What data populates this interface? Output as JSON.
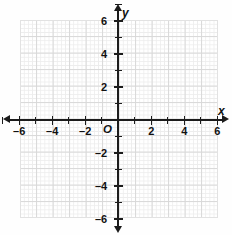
{
  "figure": {
    "type": "coordinate-plane",
    "x_axis_label": "x",
    "y_axis_label": "y",
    "origin_label": "O"
  },
  "chart_data": {
    "type": "scatter",
    "title": "",
    "subtitle": "",
    "xlabel": "x",
    "ylabel": "y",
    "xlim": [
      -7.2,
      6.1
    ],
    "ylim": [
      -6.1,
      7.2
    ],
    "grid": true,
    "legend": "none",
    "minor_ticks_per_major": 4,
    "major_tick_step": 1,
    "labeled_tick_step": 2,
    "x_tick_labels": [
      "-6",
      "-4",
      "-2",
      "2",
      "4",
      "6"
    ],
    "x_tick_values": [
      -6,
      -4,
      -2,
      2,
      4,
      6
    ],
    "y_tick_labels": [
      "6",
      "4",
      "2",
      "-2",
      "-4",
      "-6"
    ],
    "y_tick_values": [
      6,
      4,
      2,
      -2,
      -4,
      -6
    ],
    "x_unlabeled_tick_values": [
      -7,
      -5,
      -3,
      -1,
      1,
      3,
      5
    ],
    "y_unlabeled_tick_values": [
      7,
      5,
      3,
      1,
      -1,
      -3,
      -5
    ],
    "series": [],
    "annotations": [],
    "origin_marker": "O"
  },
  "ticks": {
    "x_labeled": [
      {
        "value": -6,
        "label": "-6"
      },
      {
        "value": -4,
        "label": "-4"
      },
      {
        "value": -2,
        "label": "-2"
      },
      {
        "value": 2,
        "label": "2"
      },
      {
        "value": 4,
        "label": "4"
      },
      {
        "value": 6,
        "label": "6"
      }
    ],
    "y_labeled": [
      {
        "value": 6,
        "label": "6"
      },
      {
        "value": 4,
        "label": "4"
      },
      {
        "value": 2,
        "label": "2"
      },
      {
        "value": -2,
        "label": "-2"
      },
      {
        "value": -4,
        "label": "-4"
      },
      {
        "value": -6,
        "label": "-6"
      }
    ]
  },
  "colors": {
    "axis": "#1b1b1b",
    "label": "#111111",
    "grid_major": "#d8d8d8",
    "grid_minor": "#ededed",
    "background": "#ffffff"
  }
}
